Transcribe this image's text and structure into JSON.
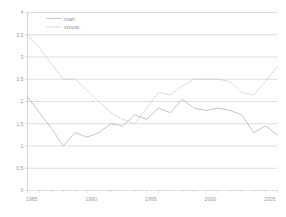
{
  "chart_data": {
    "type": "line",
    "title": "",
    "subtitle": "",
    "xlabel": "",
    "ylabel": "",
    "xlim": [
      1985,
      2006
    ],
    "ylim": [
      0,
      4
    ],
    "grid": true,
    "legend_position": "top-left",
    "y_ticks": [
      "0",
      "0,5",
      "1",
      "1,5",
      "2",
      "2,5",
      "3",
      "3,5",
      "4"
    ],
    "y_tick_values": [
      0,
      0.5,
      1,
      1.5,
      2,
      2.5,
      3,
      3.5,
      4
    ],
    "x_ticks": [
      "1985",
      "1990",
      "1995",
      "2000",
      "2005"
    ],
    "x_tick_values": [
      1985,
      1990,
      1995,
      2000,
      2005
    ],
    "x": [
      1985,
      1986,
      1987,
      1988,
      1989,
      1990,
      1991,
      1992,
      1993,
      1994,
      1995,
      1996,
      1997,
      1998,
      1999,
      2000,
      2001,
      2002,
      2003,
      2004,
      2005,
      2006
    ],
    "series": [
      {
        "name": "man",
        "style": "solid",
        "color": "#b0b0b0",
        "values": [
          2.1,
          1.75,
          1.4,
          1.0,
          1.3,
          1.2,
          1.3,
          1.5,
          1.45,
          1.7,
          1.6,
          1.85,
          1.75,
          2.05,
          1.85,
          1.8,
          1.85,
          1.8,
          1.7,
          1.3,
          1.45,
          1.25
        ]
      },
      {
        "name": "vrouw",
        "style": "dotted",
        "color": "#c8c8c8",
        "values": [
          3.5,
          3.2,
          2.85,
          2.5,
          2.5,
          2.25,
          2.0,
          1.75,
          1.6,
          1.5,
          1.85,
          2.2,
          2.15,
          2.35,
          2.5,
          2.5,
          2.5,
          2.45,
          2.2,
          2.15,
          2.45,
          2.8
        ]
      }
    ],
    "legend": [
      {
        "label": "man",
        "style": "solid"
      },
      {
        "label": "vrouw",
        "style": "dotted"
      }
    ]
  }
}
